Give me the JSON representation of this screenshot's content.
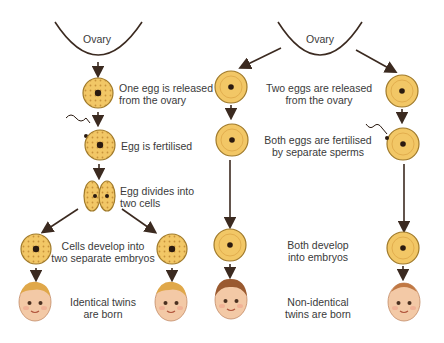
{
  "left": {
    "ovary_label": "Ovary",
    "step1": [
      "One egg is released",
      "from the ovary"
    ],
    "step2": "Egg is fertilised",
    "step3": [
      "Egg divides into",
      "two cells"
    ],
    "step4": [
      "Cells develop into",
      "two separate embryos"
    ],
    "step5": [
      "Identical twins",
      "are born"
    ]
  },
  "right": {
    "ovary_label": "Ovary",
    "step1": [
      "Two eggs are released",
      "from the ovary"
    ],
    "step2": [
      "Both eggs are fertilised",
      "by separate sperms"
    ],
    "step3": [
      "Both develop",
      "into embryos"
    ],
    "step4": [
      "Non-identical",
      "twins are born"
    ]
  },
  "colors": {
    "egg_fill": "#f2c766",
    "egg_stroke": "#a07a2a",
    "nucleus": "#2a1a10",
    "arrow": "#3b2a20",
    "skin": "#f3c9a6",
    "hair_blond": "#e0a84a",
    "hair_brown": "#9a5a30"
  }
}
